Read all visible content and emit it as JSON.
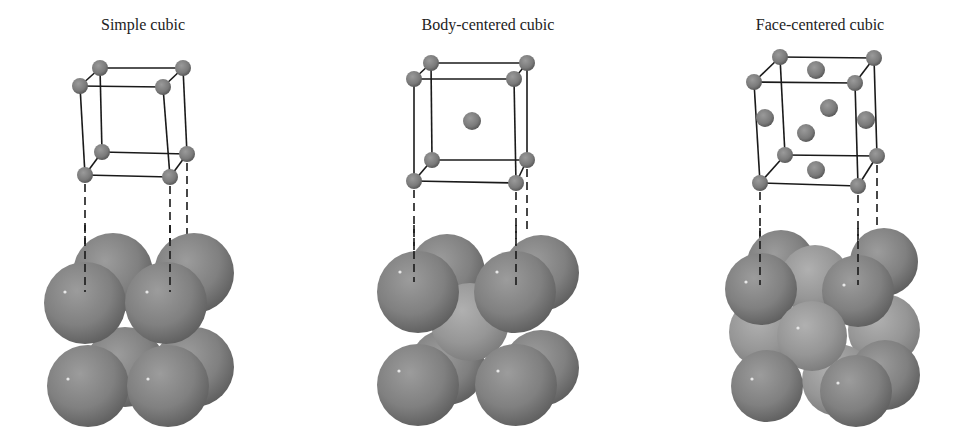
{
  "figure": {
    "panels": [
      {
        "id": "simple-cubic",
        "title": "Simple cubic",
        "title_x": 143,
        "atoms_per_cell_model": 8
      },
      {
        "id": "body-centered-cubic",
        "title": "Body-centered cubic",
        "title_x": 488,
        "atoms_per_cell_model": 9
      },
      {
        "id": "face-centered-cubic",
        "title": "Face-centered cubic",
        "title_x": 820,
        "atoms_per_cell_model": 14
      }
    ],
    "colors": {
      "atom_fill": "#808080",
      "atom_light": "#a6a6a6",
      "atom_dark": "#5e5e5e",
      "edge_line": "#1a1a1a",
      "background": "#ffffff"
    }
  }
}
